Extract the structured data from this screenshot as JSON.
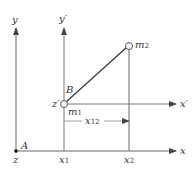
{
  "diagram": {
    "axes": {
      "y": "y",
      "y_prime": "y′",
      "x": "x",
      "x_prime": "x′",
      "z": "z",
      "z_prime": "z′"
    },
    "points": {
      "A": "A",
      "B": "B",
      "m1": "m",
      "m1_sub": "1",
      "m2": "m",
      "m2_sub": "2"
    },
    "ticks": {
      "x1": "x",
      "x1_sub": "1",
      "x2": "x",
      "x2_sub": "2"
    },
    "distance": {
      "label": "x",
      "label_sub": "12"
    },
    "colors": {
      "line": "#555555",
      "text": "#333333"
    }
  }
}
